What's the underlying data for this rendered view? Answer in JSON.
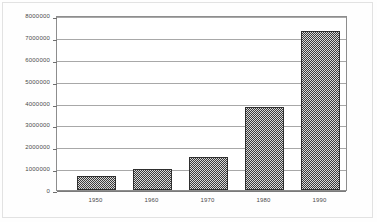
{
  "chart_data": {
    "type": "bar",
    "title": "",
    "subtitle": "",
    "xlabel": "",
    "ylabel": "",
    "categories": [
      "1950",
      "1960",
      "1970",
      "1980",
      "1990"
    ],
    "values": [
      650000,
      950000,
      1500000,
      3800000,
      7300000
    ],
    "series": [
      {
        "name": "",
        "values": [
          650000,
          950000,
          1500000,
          3800000,
          7300000
        ]
      }
    ],
    "ylim": [
      0,
      8000000
    ],
    "ytick_labels": [
      "8000000",
      "7000000",
      "6000000",
      "5000000",
      "4000000",
      "3000000",
      "2000000",
      "1000000",
      "0"
    ],
    "ytick_values": [
      8000000,
      7000000,
      6000000,
      5000000,
      4000000,
      3000000,
      2000000,
      1000000,
      0
    ],
    "grid": true,
    "legend": false,
    "legend_position": "none",
    "annotations": [],
    "colors": {
      "bar_fill": "#8a8a8a",
      "bar_edge": "#2f2f2f",
      "gridline": "#a8a8a8",
      "frame": "#8d8d8d",
      "text": "#4a4a4a",
      "background": "#ffffff"
    }
  }
}
